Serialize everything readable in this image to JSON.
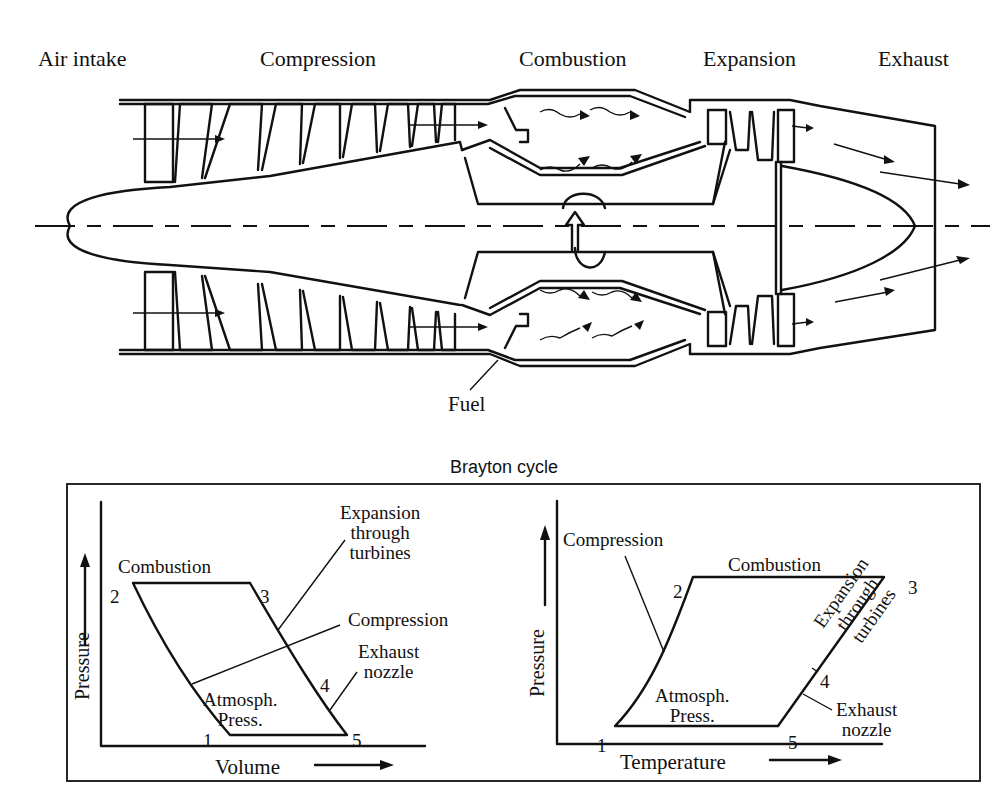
{
  "engine": {
    "section_labels": {
      "air_intake": "Air intake",
      "compression": "Compression",
      "combustion": "Combustion",
      "expansion": "Expansion",
      "exhaust": "Exhaust"
    },
    "fuel_label": "Fuel"
  },
  "cycle": {
    "title": "Brayton cycle",
    "pv_diagram": {
      "x_axis": "Volume",
      "y_axis": "Pressure",
      "points": [
        "1",
        "2",
        "3",
        "4",
        "5"
      ],
      "labels": {
        "combustion": "Combustion",
        "expansion_line1": "Expansion",
        "expansion_line2": "through",
        "expansion_line3": "turbines",
        "compression": "Compression",
        "exhaust_line1": "Exhaust",
        "exhaust_line2": "nozzle",
        "atm_line1": "Atmosph.",
        "atm_line2": "Press."
      }
    },
    "pt_diagram": {
      "x_axis": "Temperature",
      "y_axis": "Pressure",
      "points": [
        "1",
        "2",
        "3",
        "4",
        "5"
      ],
      "labels": {
        "compression": "Compression",
        "combustion": "Combustion",
        "expansion_line1": "Expansion",
        "expansion_line2": "through",
        "expansion_line3": "turbines",
        "exhaust_line1": "Exhaust",
        "exhaust_line2": "nozzle",
        "atm_line1": "Atmosph.",
        "atm_line2": "Press."
      }
    }
  }
}
